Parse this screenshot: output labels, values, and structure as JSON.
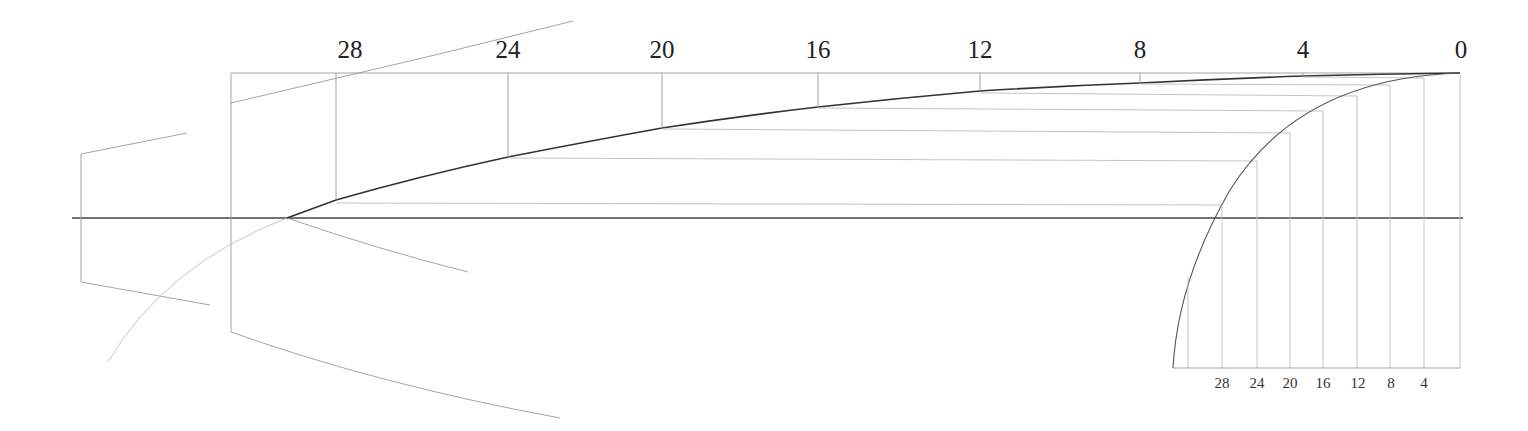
{
  "diagram": {
    "type": "geometric construction (curve projected from circular arc)",
    "top_scale": {
      "labels": [
        "28",
        "24",
        "20",
        "16",
        "12",
        "8",
        "4",
        "0"
      ],
      "x_positions": [
        350,
        508,
        662,
        818,
        980,
        1140,
        1303,
        1460
      ],
      "curve_y": [
        200,
        157,
        128,
        107,
        91,
        83,
        76,
        73
      ]
    },
    "bottom_scale": {
      "labels": [
        "28",
        "24",
        "20",
        "16",
        "12",
        "8",
        "4"
      ],
      "x_positions": [
        1222,
        1257,
        1290,
        1323,
        1357,
        1390,
        1424
      ],
      "arc_y": [
        205,
        194,
        162,
        141,
        113,
        97,
        80
      ]
    },
    "colors": {
      "background": "#ffffff",
      "line_dark": "#333333",
      "line_light": "#9a9a9a",
      "text": "#222222"
    }
  }
}
